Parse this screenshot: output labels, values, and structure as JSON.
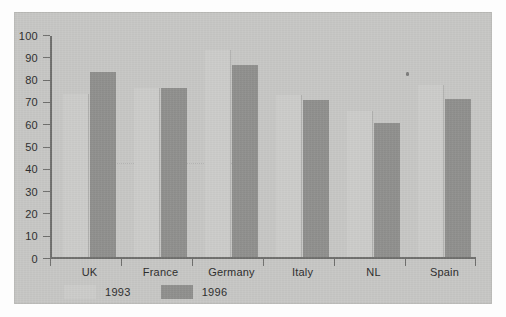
{
  "chart_data": {
    "type": "bar",
    "title": "",
    "subtitle": "",
    "xlabel": "",
    "ylabel": "",
    "categories": [
      "UK",
      "France",
      "Germany",
      "Italy",
      "NL",
      "Spain"
    ],
    "series": [
      {
        "name": "1993",
        "color": "#cbcbc9",
        "values": [
          73,
          76,
          93,
          72.5,
          65.5,
          77
        ]
      },
      {
        "name": "1996",
        "color": "#8f8f8d",
        "values": [
          83,
          76,
          86,
          70.5,
          60,
          71
        ]
      }
    ],
    "ylim": [
      0,
      100
    ],
    "ytick_labels": [
      "100",
      "90",
      "80",
      "70",
      "60",
      "50",
      "40",
      "30",
      "20",
      "10",
      "0"
    ],
    "ytick_values": [
      100,
      90,
      80,
      70,
      60,
      50,
      40,
      30,
      20,
      10,
      0
    ],
    "grid": false,
    "legend_position": "bottom-left",
    "annotations": []
  },
  "legend": {
    "items": [
      {
        "label": "1993",
        "swatch": "light-gray"
      },
      {
        "label": "1996",
        "swatch": "dark-gray"
      }
    ]
  },
  "colors": {
    "panel_background": "#c6c6c4",
    "page_background": "#fdfdfd",
    "axis": "#6e6e6c",
    "text": "#2b2b2b",
    "series_1993": "#cbcbc9",
    "series_1996": "#8f8f8d"
  }
}
